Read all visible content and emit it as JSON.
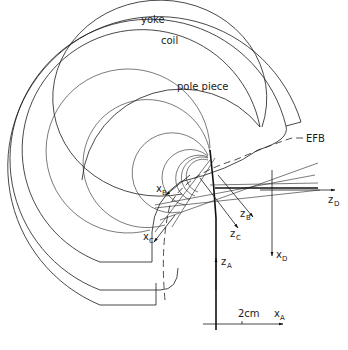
{
  "diagram": {
    "labels": {
      "yoke": "yoke",
      "coil": "coil",
      "pole_piece": "pole piece",
      "efb": "EFB",
      "scale": "2cm"
    },
    "axes": {
      "xA": {
        "main": "x",
        "sub": "A"
      },
      "zA": {
        "main": "z",
        "sub": "A"
      },
      "xB": {
        "main": "x",
        "sub": "B"
      },
      "zB": {
        "main": "z",
        "sub": "B"
      },
      "xC": {
        "main": "x",
        "sub": "C"
      },
      "zC": {
        "main": "z",
        "sub": "C"
      },
      "xD": {
        "main": "x",
        "sub": "D"
      },
      "zD": {
        "main": "z",
        "sub": "D"
      }
    }
  }
}
